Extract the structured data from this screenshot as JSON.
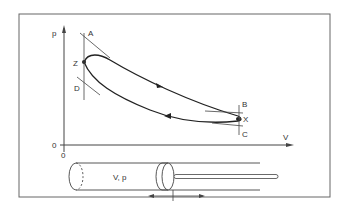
{
  "diagram": {
    "axes": {
      "y_label": "p",
      "x_label": "V",
      "origin_y": "0",
      "origin_x": "0"
    },
    "points": {
      "A": "A",
      "Z": "Z",
      "D": "D",
      "B": "B",
      "X": "X",
      "C": "C"
    },
    "cylinder_label": "V, p",
    "colors": {
      "stroke": "#333333",
      "frame": "#555555",
      "background": "#ffffff"
    }
  }
}
